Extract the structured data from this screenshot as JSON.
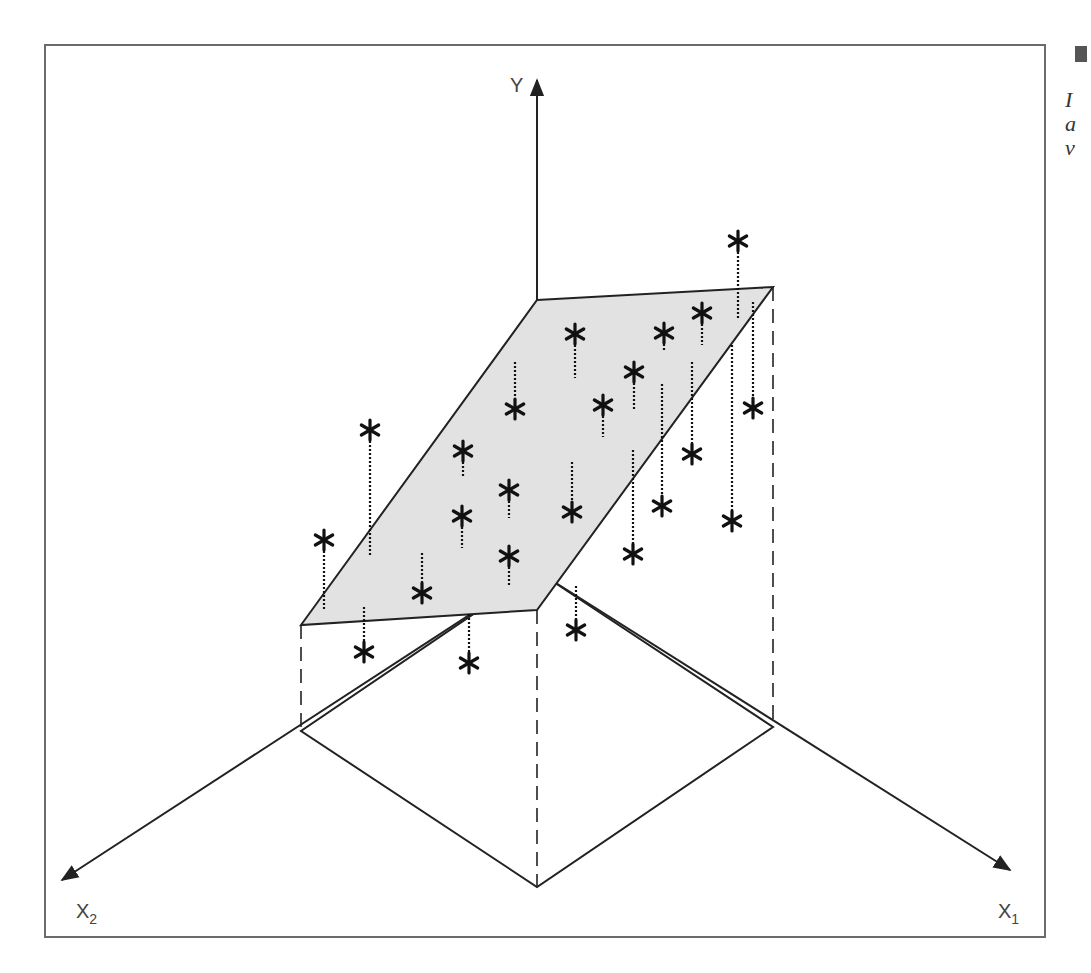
{
  "figure": {
    "type": "3d-regression-plane-diagram",
    "axes": {
      "y_label": "Y",
      "x1_label": "X",
      "x1_subscript": "1",
      "x2_label": "X",
      "x2_subscript": "2"
    },
    "caption_fragment": [
      "I",
      "a",
      "v"
    ],
    "colors": {
      "frame": "#6b6b6b",
      "line": "#222222",
      "plane_fill": "#e2e2e2",
      "marker": "#111111"
    }
  },
  "geometry": {
    "frame": {
      "x": 45,
      "y": 45,
      "w": 1000,
      "h": 892
    },
    "origin": [
      537,
      571
    ],
    "y_axis_top": [
      537,
      80
    ],
    "x1_axis_end": [
      1010,
      870
    ],
    "x2_axis_end": [
      62,
      880
    ],
    "plane": [
      [
        537,
        300
      ],
      [
        773,
        287
      ],
      [
        537,
        610
      ],
      [
        301,
        625
      ]
    ],
    "base": [
      [
        537,
        571
      ],
      [
        773,
        727
      ],
      [
        537,
        887
      ],
      [
        301,
        731
      ]
    ],
    "projection_lines": [
      [
        [
          301,
          625
        ],
        [
          301,
          731
        ]
      ],
      [
        [
          537,
          610
        ],
        [
          537,
          887
        ]
      ],
      [
        [
          773,
          287
        ],
        [
          773,
          727
        ]
      ]
    ],
    "points": [
      {
        "star": [
          738,
          241
        ],
        "line": [
          [
            738,
            252
          ],
          [
            738,
            318
          ]
        ],
        "side": "above"
      },
      {
        "star": [
          702,
          313
        ],
        "line": [
          [
            702,
            324
          ],
          [
            702,
            345
          ]
        ],
        "side": "above"
      },
      {
        "star": [
          664,
          333
        ],
        "line": [
          [
            664,
            344
          ],
          [
            664,
            352
          ]
        ],
        "side": "above"
      },
      {
        "star": [
          575,
          334
        ],
        "line": [
          [
            575,
            345
          ],
          [
            575,
            378
          ]
        ],
        "side": "above"
      },
      {
        "star": [
          634,
          372
        ],
        "line": [
          [
            634,
            383
          ],
          [
            634,
            410
          ]
        ],
        "side": "above"
      },
      {
        "star": [
          603,
          405
        ],
        "line": [
          [
            603,
            416
          ],
          [
            603,
            437
          ]
        ],
        "side": "above"
      },
      {
        "star": [
          515,
          409
        ],
        "line": [
          [
            515,
            362
          ],
          [
            515,
            398
          ]
        ],
        "side": "below"
      },
      {
        "star": [
          753,
          408
        ],
        "line": [
          [
            753,
            302
          ],
          [
            753,
            397
          ]
        ],
        "side": "below"
      },
      {
        "star": [
          692,
          454
        ],
        "line": [
          [
            692,
            362
          ],
          [
            692,
            443
          ]
        ],
        "side": "below"
      },
      {
        "star": [
          370,
          430
        ],
        "line": [
          [
            370,
            441
          ],
          [
            370,
            555
          ]
        ],
        "side": "above"
      },
      {
        "star": [
          463,
          451
        ],
        "line": [
          [
            463,
            462
          ],
          [
            463,
            478
          ]
        ],
        "side": "above"
      },
      {
        "star": [
          509,
          490
        ],
        "line": [
          [
            509,
            501
          ],
          [
            509,
            518
          ]
        ],
        "side": "above"
      },
      {
        "star": [
          462,
          516
        ],
        "line": [
          [
            462,
            527
          ],
          [
            462,
            548
          ]
        ],
        "side": "above"
      },
      {
        "star": [
          572,
          512
        ],
        "line": [
          [
            572,
            462
          ],
          [
            572,
            501
          ]
        ],
        "side": "below"
      },
      {
        "star": [
          662,
          506
        ],
        "line": [
          [
            662,
            384
          ],
          [
            662,
            495
          ]
        ],
        "side": "below"
      },
      {
        "star": [
          732,
          521
        ],
        "line": [
          [
            732,
            345
          ],
          [
            732,
            510
          ]
        ],
        "side": "below"
      },
      {
        "star": [
          633,
          554
        ],
        "line": [
          [
            633,
            450
          ],
          [
            633,
            543
          ]
        ],
        "side": "below"
      },
      {
        "star": [
          509,
          556
        ],
        "line": [
          [
            509,
            567
          ],
          [
            509,
            585
          ]
        ],
        "side": "above"
      },
      {
        "star": [
          324,
          540
        ],
        "line": [
          [
            324,
            551
          ],
          [
            324,
            610
          ]
        ],
        "side": "above"
      },
      {
        "star": [
          422,
          593
        ],
        "line": [
          [
            422,
            553
          ],
          [
            422,
            582
          ]
        ],
        "side": "below"
      },
      {
        "star": [
          576,
          630
        ],
        "line": [
          [
            576,
            586
          ],
          [
            576,
            619
          ]
        ],
        "side": "below"
      },
      {
        "star": [
          364,
          652
        ],
        "line": [
          [
            364,
            607
          ],
          [
            364,
            641
          ]
        ],
        "side": "below"
      },
      {
        "star": [
          469,
          663
        ],
        "line": [
          [
            469,
            614
          ],
          [
            469,
            652
          ]
        ],
        "side": "below"
      }
    ]
  }
}
